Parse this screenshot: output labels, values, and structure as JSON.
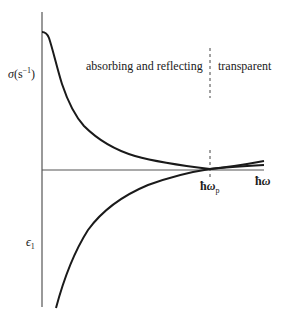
{
  "diagram": {
    "type": "physics-plot",
    "regions": {
      "left": "absorbing and reflecting",
      "right": "transparent"
    },
    "y_axis_upper_label": {
      "symbol": "σ",
      "unit_open": "(s",
      "unit_exp": "−1",
      "unit_close": ")"
    },
    "y_axis_lower_label": {
      "symbol": "ϵ",
      "subscript": "1"
    },
    "x_axis_label": {
      "hbar": "ħ",
      "symbol": "ω"
    },
    "plasma_marker_label": {
      "hbar": "ħ",
      "symbol": "ω",
      "subscript": "p"
    },
    "curves": [
      {
        "name": "sigma",
        "description": "conductivity σ decreasing from high value toward zero, crossing near ħωp"
      },
      {
        "name": "epsilon1",
        "description": "real dielectric ϵ1 rising from large negative to cross zero at ħωp"
      }
    ],
    "colors": {
      "ink": "#1a1a1a",
      "axis": "#555555",
      "background": "#ffffff"
    }
  }
}
